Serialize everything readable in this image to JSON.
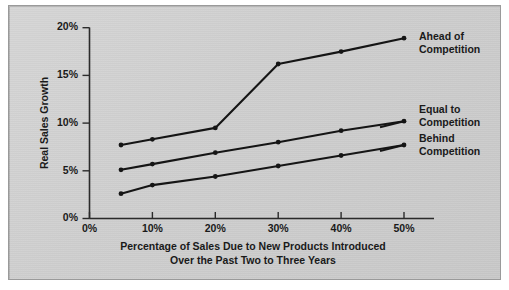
{
  "chart_data": {
    "type": "line",
    "title": "",
    "xlabel": "Percentage of Sales Due to New Products Introduced Over the Past Two to Three Years",
    "xlabel_lines": [
      "Percentage of Sales Due to New Products Introduced",
      "Over the Past Two to Three Years"
    ],
    "ylabel": "Real Sales Growth",
    "x": [
      5,
      10,
      20,
      30,
      40,
      50
    ],
    "xlim": [
      0,
      55
    ],
    "ylim": [
      0,
      20
    ],
    "xticks": [
      0,
      10,
      20,
      30,
      40,
      50
    ],
    "yticks": [
      0,
      5,
      10,
      15,
      20
    ],
    "xtick_labels": [
      "0%",
      "10%",
      "20%",
      "30%",
      "40%",
      "50%"
    ],
    "ytick_labels": [
      "0%",
      "5%",
      "10%",
      "15%",
      "20%"
    ],
    "grid": false,
    "legend_position": "right-inline",
    "markers": "dot",
    "series": [
      {
        "name": "Ahead of Competition",
        "label_lines": [
          "Ahead of",
          "Competition"
        ],
        "color": "#151515",
        "values": [
          7.7,
          8.3,
          9.5,
          16.2,
          17.5,
          18.9
        ]
      },
      {
        "name": "Equal to Competition",
        "label_lines": [
          "Equal to",
          "Competition"
        ],
        "color": "#151515",
        "values": [
          5.1,
          5.7,
          6.9,
          8.0,
          9.2,
          10.2
        ]
      },
      {
        "name": "Behind Competition",
        "label_lines": [
          "Behind",
          "Competition"
        ],
        "color": "#151515",
        "values": [
          2.6,
          3.5,
          4.4,
          5.5,
          6.6,
          7.7
        ]
      }
    ]
  },
  "figure": {
    "background_color": "#cfcfcf",
    "border_color": "#9a9a9a",
    "ink_color": "#151515"
  }
}
